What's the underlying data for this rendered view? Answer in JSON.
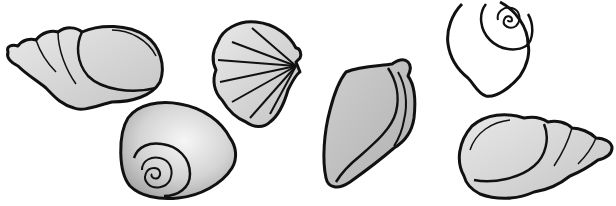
{
  "image": {
    "title": "Seashells clip art",
    "description": "Six black-outlined grey seashells on a white background",
    "colors": {
      "background": "#ffffff",
      "outline": "#111111",
      "fill_light": "#f2f2f2",
      "fill_mid": "#c8c8c8",
      "fill_dark": "#9a9a9a"
    }
  },
  "shells": [
    {
      "id": "whelk-left",
      "kind": "whelk shell",
      "position": "top-left"
    },
    {
      "id": "moon-snail-bottom",
      "kind": "moon snail shell with spiral",
      "position": "bottom-left-center"
    },
    {
      "id": "scallop",
      "kind": "scallop shell",
      "position": "top-center"
    },
    {
      "id": "conch",
      "kind": "conch shell",
      "position": "center"
    },
    {
      "id": "moon-snail-top-right",
      "kind": "moon snail shell outline with spiral",
      "position": "top-right"
    },
    {
      "id": "whelk-right",
      "kind": "whelk shell",
      "position": "bottom-right"
    }
  ]
}
